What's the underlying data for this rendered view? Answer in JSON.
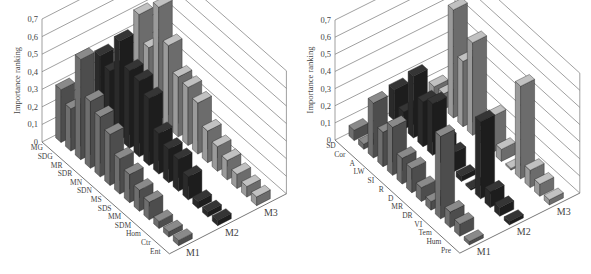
{
  "chart_data": [
    {
      "type": "bar",
      "subtype": "3d-bar",
      "title": "",
      "ylabel": "Importance ranking",
      "ylim": [
        0,
        0.7
      ],
      "yticks": [
        "0",
        "0,1",
        "0,2",
        "0,3",
        "0,4",
        "0,5",
        "0,6",
        "0,7"
      ],
      "grid": true,
      "categories": [
        "MG",
        "SDG",
        "MR",
        "SDR",
        "MN",
        "SDN",
        "MS",
        "SDS",
        "MM",
        "SDM",
        "Hom",
        "Ctr",
        "Ent"
      ],
      "series": [
        {
          "name": "M1",
          "color": "#6e6e6e",
          "values": [
            0.3,
            0.24,
            0.57,
            0.38,
            0.34,
            0.29,
            0.2,
            0.16,
            0.12,
            0.1,
            0.04,
            0.03,
            0.03
          ]
        },
        {
          "name": "M2",
          "color": "#2a2a2a",
          "values": [
            0.38,
            0.34,
            0.56,
            0.44,
            0.43,
            0.38,
            0.23,
            0.19,
            0.18,
            0.13,
            0.04,
            0.03,
            0.03
          ]
        },
        {
          "name": "M3",
          "color": "#9a9a9a",
          "values": [
            0.5,
            0.36,
            0.64,
            0.47,
            0.34,
            0.33,
            0.29,
            0.18,
            0.14,
            0.11,
            0.08,
            0.06,
            0.05
          ]
        }
      ]
    },
    {
      "type": "bar",
      "subtype": "3d-bar",
      "title": "",
      "ylabel": "Importance ranking",
      "ylim": [
        0,
        0.7
      ],
      "yticks": [
        "0",
        "0,1",
        "0,2",
        "0,3",
        "0,4",
        "0,5",
        "0,6",
        "0,7"
      ],
      "grid": true,
      "categories": [
        "SD",
        "Cor",
        "A",
        "LW",
        "SI",
        "R",
        "D",
        "MR",
        "DR",
        "VI",
        "Tem",
        "Hum",
        "Pre"
      ],
      "series": [
        {
          "name": "M1",
          "color": "#6e6e6e",
          "values": [
            0.06,
            0.03,
            0.32,
            0.2,
            0.28,
            0.15,
            0.14,
            0.08,
            0.05,
            0.48,
            0.09,
            0.07,
            0.02
          ]
        },
        {
          "name": "M2",
          "color": "#2a2a2a",
          "values": [
            0.18,
            0.1,
            0.36,
            0.26,
            0.3,
            0.14,
            0.11,
            0.03,
            0.01,
            0.45,
            0.09,
            0.05,
            0.02
          ]
        },
        {
          "name": "M3",
          "color": "#9a9a9a",
          "values": [
            0.08,
            0.09,
            0.63,
            0.38,
            0.54,
            0.07,
            0.21,
            0.07,
            0.01,
            0.54,
            0.1,
            0.07,
            0.03
          ]
        }
      ]
    }
  ]
}
